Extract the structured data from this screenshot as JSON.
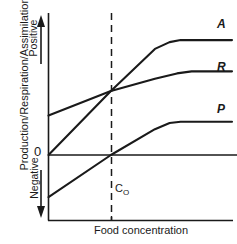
{
  "chart_data": {
    "type": "line",
    "title": "",
    "xlabel": "Food concentration",
    "ylabel": "Production/Respiration/Assimilation",
    "y_axis_direction_labels": {
      "positive": "Positive",
      "negative": "Negative",
      "zero_tick": "0"
    },
    "grid": false,
    "legend_position": "right-inline-curve-labels",
    "xlim": [
      0,
      1
    ],
    "ylim": [
      -0.35,
      1.0
    ],
    "annotations": [
      {
        "name": "threshold-line",
        "text": "C",
        "subscript": "O",
        "full_text": "CO",
        "x": 0.34,
        "style": "dashed-vertical"
      },
      {
        "name": "zero-line",
        "text": "0",
        "y": 0,
        "style": "solid-horizontal"
      }
    ],
    "series": [
      {
        "name": "A",
        "label": "A",
        "description": "Assimilation: rises linearly from zero then saturates",
        "x": [
          0.0,
          0.34,
          0.58,
          0.66,
          0.72,
          1.0
        ],
        "y": [
          0.0,
          0.47,
          0.78,
          0.83,
          0.845,
          0.845
        ]
      },
      {
        "name": "R",
        "label": "R",
        "description": "Respiration: positive intercept, shallow rise then saturates",
        "x": [
          0.0,
          0.34,
          0.58,
          0.7,
          0.78,
          1.0
        ],
        "y": [
          0.29,
          0.47,
          0.56,
          0.6,
          0.615,
          0.615
        ]
      },
      {
        "name": "P",
        "label": "P",
        "description": "Production: negative intercept, crosses zero at CO then saturates",
        "x": [
          0.0,
          0.34,
          0.58,
          0.66,
          0.72,
          1.0
        ],
        "y": [
          -0.31,
          0.0,
          0.19,
          0.235,
          0.245,
          0.245
        ]
      }
    ],
    "colors": {
      "curve": "#1a1a1a",
      "axis": "#1a1a1a",
      "background": "#ffffff"
    }
  },
  "axes": {
    "y_title": "Production/Respiration/Assimilation",
    "y_positive": "Positive",
    "y_negative": "Negative",
    "y_zero": "0",
    "x_title": "Food concentration"
  },
  "curve_labels": {
    "a": "A",
    "r": "R",
    "p": "P"
  },
  "threshold": {
    "base": "C",
    "subscript": "O"
  }
}
